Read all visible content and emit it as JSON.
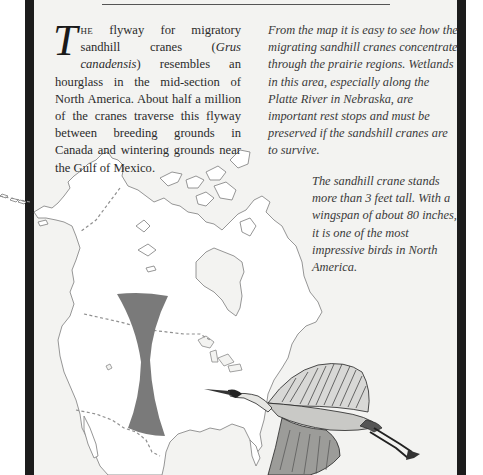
{
  "header": {
    "rule": true
  },
  "left_column": {
    "drop_cap": "T",
    "lead_smallcaps": "he",
    "text_before_italic": " flyway for migratory sandhill cranes (",
    "italic_species": "Grus canadensis",
    "text_after_italic": ") resembles an hourglass in the mid-section of North America. About half a million of the cranes traverse this flyway between breeding grounds in Canada and wintering grounds near the Gulf of Mexico."
  },
  "right_column": {
    "paragraph_1": "From the map it is easy to see how the migrating sandhill cranes concentrate through the prairie regions. Wetlands in this area, especially along the Platte River in Nebraska, are important rest stops and must be preserved if the sandshill cranes are to survive.",
    "paragraph_2": "The sandhill crane stands more than 3 feet tall. With a wingspan of about 80 inches, it is one of the most impressive birds in North America."
  },
  "map": {
    "region": "North America",
    "flyway_shape": "hourglass",
    "flyway_color": "#7a7a7a",
    "outline_color": "#8a8a8a",
    "border_style": "dashed"
  },
  "illustration": {
    "subject": "sandhill crane in flight"
  },
  "colors": {
    "paper": "#f3f3f1",
    "frame": "#1c1c1c",
    "text": "#2b2b2b"
  }
}
